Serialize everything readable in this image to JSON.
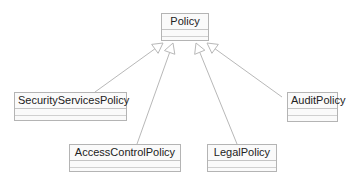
{
  "diagram": {
    "type": "uml-class-inheritance",
    "colors": {
      "border": "#b4b4b4",
      "fill": "#fafafa",
      "text": "#222222",
      "edge": "#b8b8b8"
    },
    "classes": [
      {
        "id": "policy",
        "name": "Policy",
        "x": 161,
        "y": 13,
        "w": 48,
        "h": 28
      },
      {
        "id": "security",
        "name": "SecurityServicesPolicy",
        "x": 14,
        "y": 92,
        "w": 113,
        "h": 29
      },
      {
        "id": "audit",
        "name": "AuditPolicy",
        "x": 287,
        "y": 92,
        "w": 51,
        "h": 30
      },
      {
        "id": "access",
        "name": "AccessControlPolicy",
        "x": 69,
        "y": 144,
        "w": 112,
        "h": 28
      },
      {
        "id": "legal",
        "name": "LegalPolicy",
        "x": 207,
        "y": 144,
        "w": 70,
        "h": 28
      }
    ],
    "generalizations": [
      {
        "from": "security",
        "to": "policy",
        "x1": 95,
        "y1": 92,
        "x2": 163,
        "y2": 43
      },
      {
        "from": "access",
        "to": "policy",
        "x1": 137,
        "y1": 144,
        "x2": 173,
        "y2": 43
      },
      {
        "from": "legal",
        "to": "policy",
        "x1": 237,
        "y1": 144,
        "x2": 196,
        "y2": 43
      },
      {
        "from": "audit",
        "to": "policy",
        "x1": 282,
        "y1": 97,
        "x2": 207,
        "y2": 43
      }
    ]
  }
}
